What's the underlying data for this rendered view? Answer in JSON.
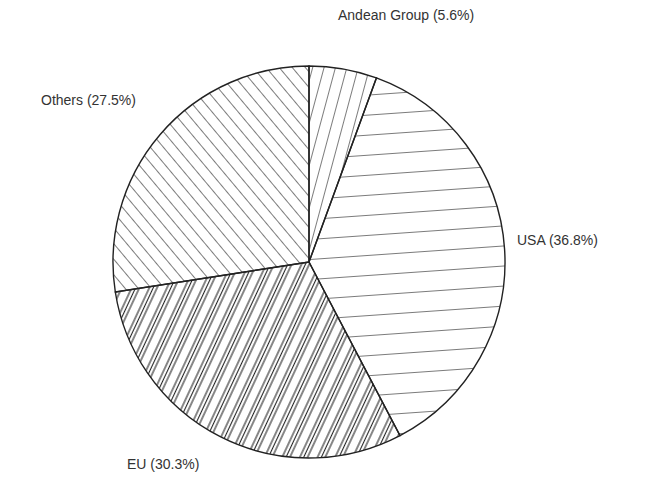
{
  "chart_data": {
    "type": "pie",
    "title": "",
    "categories": [
      "Andean Group",
      "USA",
      "EU",
      "Others"
    ],
    "values": [
      5.6,
      36.8,
      30.3,
      27.5
    ],
    "labels": [
      "Andean Group (5.6%)",
      "USA (36.8%)",
      "EU (30.3%)",
      "Others (27.5%)"
    ],
    "patterns": [
      "steep-forward-hatch",
      "horizontal-hatch",
      "dense-forward-hatch",
      "back-diagonal-hatch"
    ],
    "legend": "none (direct labels)",
    "start_angle_deg": 0,
    "direction": "clockwise"
  }
}
